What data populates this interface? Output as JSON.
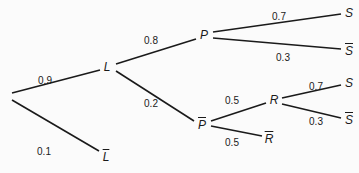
{
  "diagram": {
    "type": "probability-tree",
    "nodes": [
      {
        "id": "root",
        "label": "",
        "x": 10,
        "y": 95
      },
      {
        "id": "L",
        "label": "L",
        "complement": false,
        "x": 107,
        "y": 67
      },
      {
        "id": "notL",
        "label": "L",
        "complement": true,
        "x": 106,
        "y": 157
      },
      {
        "id": "P",
        "label": "P",
        "complement": false,
        "x": 204,
        "y": 35
      },
      {
        "id": "notP",
        "label": "P",
        "complement": true,
        "x": 202,
        "y": 125
      },
      {
        "id": "S1",
        "label": "S",
        "complement": false,
        "x": 349,
        "y": 13
      },
      {
        "id": "notS1",
        "label": "S",
        "complement": true,
        "x": 349,
        "y": 51
      },
      {
        "id": "R",
        "label": "R",
        "complement": false,
        "x": 274,
        "y": 100
      },
      {
        "id": "notR",
        "label": "R",
        "complement": true,
        "x": 269,
        "y": 139
      },
      {
        "id": "S2",
        "label": "S",
        "complement": false,
        "x": 349,
        "y": 83
      },
      {
        "id": "notS2",
        "label": "S",
        "complement": true,
        "x": 349,
        "y": 120
      }
    ],
    "edges": [
      {
        "from": "root",
        "to": "L",
        "prob": "0.9",
        "x1": 12,
        "y1": 93,
        "x2": 100,
        "y2": 70,
        "lx": 45,
        "ly": 80
      },
      {
        "from": "root",
        "to": "notL",
        "prob": "0.1",
        "x1": 12,
        "y1": 100,
        "x2": 99,
        "y2": 151,
        "lx": 44,
        "ly": 151
      },
      {
        "from": "L",
        "to": "P",
        "prob": "0.8",
        "x1": 116,
        "y1": 64,
        "x2": 196,
        "y2": 39,
        "lx": 151,
        "ly": 40
      },
      {
        "from": "L",
        "to": "notP",
        "prob": "0.2",
        "x1": 116,
        "y1": 71,
        "x2": 194,
        "y2": 121,
        "lx": 151,
        "ly": 103
      },
      {
        "from": "P",
        "to": "S1",
        "prob": "0.7",
        "x1": 213,
        "y1": 32,
        "x2": 341,
        "y2": 14,
        "lx": 279,
        "ly": 16
      },
      {
        "from": "P",
        "to": "notS1",
        "prob": "0.3",
        "x1": 213,
        "y1": 38,
        "x2": 341,
        "y2": 49,
        "lx": 283,
        "ly": 57
      },
      {
        "from": "notP",
        "to": "R",
        "prob": "0.5",
        "x1": 211,
        "y1": 121,
        "x2": 266,
        "y2": 103,
        "lx": 232,
        "ly": 100
      },
      {
        "from": "notP",
        "to": "notR",
        "prob": "0.5",
        "x1": 211,
        "y1": 126,
        "x2": 262,
        "y2": 136,
        "lx": 232,
        "ly": 142
      },
      {
        "from": "R",
        "to": "S2",
        "prob": "0.7",
        "x1": 282,
        "y1": 98,
        "x2": 341,
        "y2": 85,
        "lx": 316,
        "ly": 86
      },
      {
        "from": "R",
        "to": "notS2",
        "prob": "0.3",
        "x1": 282,
        "y1": 104,
        "x2": 341,
        "y2": 118,
        "lx": 316,
        "ly": 121
      }
    ]
  }
}
